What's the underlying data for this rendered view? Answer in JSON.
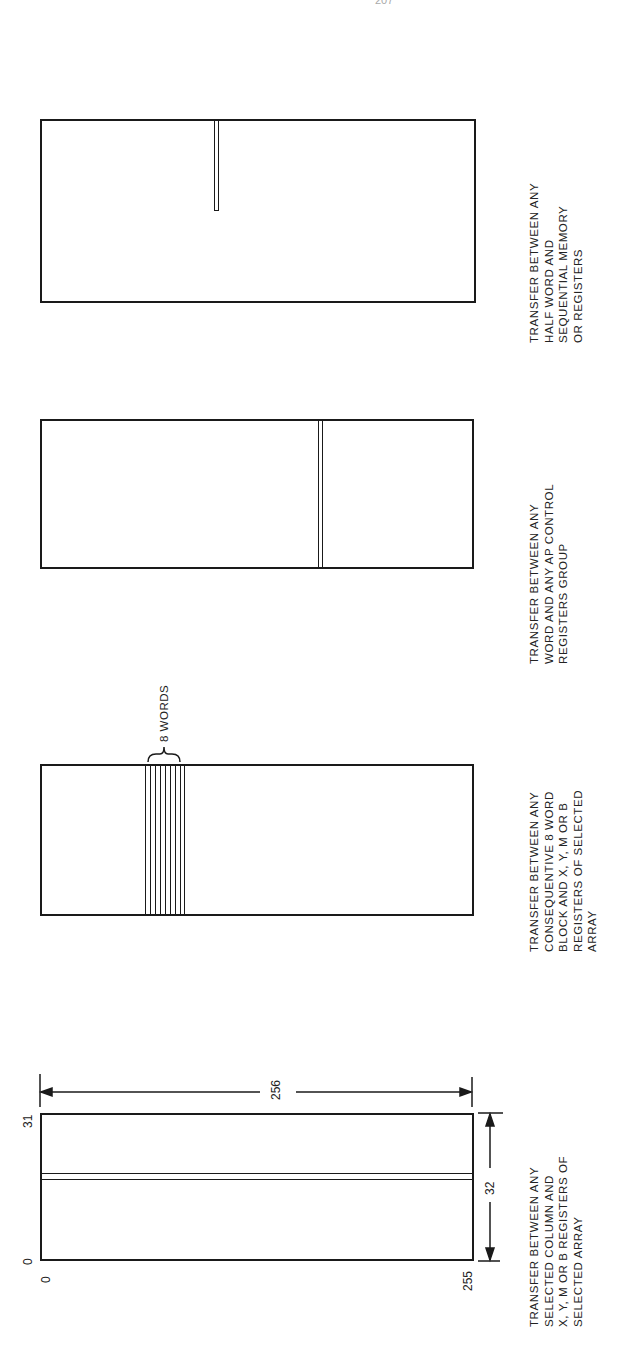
{
  "page": {
    "number": "207"
  },
  "figures": [
    {
      "id": "column-transfer",
      "caption_lines": [
        "TRANSFER BETWEEN ANY",
        "SELECTED COLUMN AND",
        "X, Y, M OR B REGISTERS OF",
        "SELECTED ARRAY"
      ],
      "labels": {
        "top_left": "31",
        "bottom_left": "0",
        "origin": "0",
        "bottom_right": "255",
        "width_dim": "256",
        "height_dim": "32"
      }
    },
    {
      "id": "block-transfer",
      "caption_lines": [
        "TRANSFER BETWEEN ANY",
        "CONSEQUENTIVE 8 WORD",
        "BLOCK AND X, Y, M OR B",
        "REGISTERS OF SELECTED",
        "ARRAY"
      ],
      "labels": {
        "brace": "8 WORDS"
      }
    },
    {
      "id": "control-register-transfer",
      "caption_lines": [
        "TRANSFER BETWEEN ANY",
        "WORD AND ANY AP CONTROL",
        "REGISTERS GROUP"
      ]
    },
    {
      "id": "half-word-transfer",
      "caption_lines": [
        "TRANSFER BETWEEN ANY",
        "HALF WORD AND",
        "SEQUENTIAL MEMORY",
        "OR REGISTERS"
      ]
    }
  ],
  "colors": {
    "ink": "#1a1a1a",
    "paper": "#ffffff"
  }
}
